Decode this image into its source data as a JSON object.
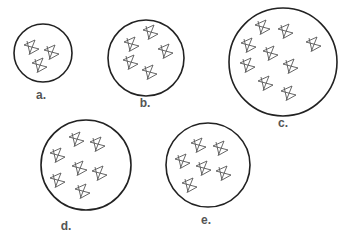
{
  "figure": {
    "colors": {
      "outline": "#222222",
      "star": "#555555",
      "label": "#555555",
      "background": "#ffffff"
    },
    "panels": [
      {
        "label": "a.",
        "star_count": 3,
        "circle": {
          "cx": 43,
          "cy": 53,
          "r": 29
        },
        "label_pos": {
          "x": 41,
          "y": 98
        },
        "stars": [
          [
            31,
            47
          ],
          [
            51,
            52
          ],
          [
            39,
            65
          ]
        ]
      },
      {
        "label": "b.",
        "star_count": 5,
        "circle": {
          "cx": 146,
          "cy": 58,
          "r": 38
        },
        "label_pos": {
          "x": 145,
          "y": 106
        },
        "stars": [
          [
            131,
            44
          ],
          [
            150,
            32
          ],
          [
            165,
            51
          ],
          [
            130,
            62
          ],
          [
            149,
            72
          ]
        ]
      },
      {
        "label": "c.",
        "star_count": 9,
        "circle": {
          "cx": 283,
          "cy": 62,
          "r": 54
        },
        "label_pos": {
          "x": 283,
          "y": 126
        },
        "stars": [
          [
            262,
            27
          ],
          [
            285,
            31
          ],
          [
            313,
            44
          ],
          [
            248,
            45
          ],
          [
            270,
            53
          ],
          [
            247,
            65
          ],
          [
            290,
            66
          ],
          [
            265,
            83
          ],
          [
            288,
            93
          ]
        ]
      },
      {
        "label": "d.",
        "star_count": 7,
        "circle": {
          "cx": 86,
          "cy": 165,
          "r": 45
        },
        "label_pos": {
          "x": 66,
          "y": 229
        },
        "stars": [
          [
            76,
            139
          ],
          [
            97,
            144
          ],
          [
            57,
            155
          ],
          [
            79,
            168
          ],
          [
            99,
            173
          ],
          [
            57,
            180
          ],
          [
            82,
            191
          ]
        ]
      },
      {
        "label": "e.",
        "star_count": 6,
        "circle": {
          "cx": 208,
          "cy": 165,
          "r": 42
        },
        "label_pos": {
          "x": 206,
          "y": 223
        },
        "stars": [
          [
            198,
            145
          ],
          [
            220,
            148
          ],
          [
            182,
            161
          ],
          [
            203,
            168
          ],
          [
            223,
            173
          ],
          [
            189,
            185
          ]
        ]
      }
    ]
  }
}
